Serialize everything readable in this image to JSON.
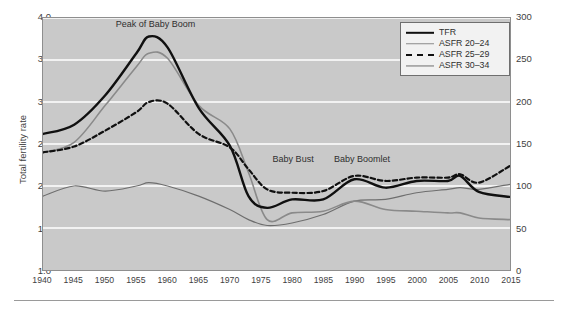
{
  "chart_data": {
    "type": "line",
    "title": "",
    "xlabel": "",
    "ylabel": "Total fertility rate",
    "ylabel_right": "ASFR (births per 1,000 women)",
    "xlim": [
      1940,
      2015
    ],
    "ylim": [
      1.0,
      4.0
    ],
    "ylim_right": [
      0,
      300
    ],
    "grid": true,
    "legend_position": "top-right",
    "xticks": [
      1940,
      1945,
      1950,
      1955,
      1960,
      1965,
      1970,
      1975,
      1980,
      1985,
      1990,
      1995,
      2000,
      2005,
      2010,
      2015
    ],
    "yticks": [
      "1.0",
      "1.5",
      "2.0",
      "2.5",
      "3.0",
      "3.5",
      "4.0"
    ],
    "yticks_right": [
      "0",
      "50",
      "100",
      "150",
      "200",
      "250",
      "300"
    ],
    "x": [
      1940,
      1945,
      1950,
      1955,
      1957,
      1960,
      1965,
      1970,
      1973,
      1976,
      1980,
      1985,
      1990,
      1995,
      2000,
      2005,
      2007,
      2010,
      2015
    ],
    "series": [
      {
        "name": "TFR",
        "color": "#101010",
        "style": "solid",
        "width": 2.4,
        "axis": "left",
        "values": [
          2.62,
          2.73,
          3.08,
          3.58,
          3.78,
          3.65,
          2.93,
          2.48,
          1.88,
          1.74,
          1.84,
          1.84,
          2.08,
          1.98,
          2.06,
          2.06,
          2.12,
          1.93,
          1.87
        ]
      },
      {
        "name": "ASFR 20-24",
        "color": "#8a8a8a",
        "style": "solid",
        "width": 1.6,
        "axis": "right",
        "values": [
          140,
          152,
          196,
          242,
          258,
          252,
          196,
          168,
          116,
          60,
          68,
          70,
          82,
          72,
          70,
          68,
          68,
          62,
          60
        ]
      },
      {
        "name": "ASFR 25-29",
        "color": "#101010",
        "style": "dashed",
        "width": 2.2,
        "axis": "right",
        "values": [
          140,
          147,
          166,
          188,
          200,
          198,
          162,
          146,
          120,
          96,
          92,
          94,
          112,
          106,
          110,
          110,
          114,
          104,
          124
        ]
      },
      {
        "name": "ASFR 30-34",
        "color": "#6e6e6e",
        "style": "solid",
        "width": 1.2,
        "axis": "right",
        "values": [
          88,
          100,
          94,
          100,
          104,
          100,
          88,
          72,
          60,
          53,
          56,
          66,
          82,
          84,
          92,
          96,
          98,
          96,
          102
        ]
      }
    ],
    "annotations": [
      {
        "text": "Peak of Baby Boom",
        "x": 1958,
        "y": 3.92
      },
      {
        "text": "Baby Bust",
        "x": 1980,
        "y": 2.32
      },
      {
        "text": "Baby Boomlet",
        "x": 1991,
        "y": 2.32
      }
    ]
  },
  "legend": {
    "items": [
      {
        "label": "TFR"
      },
      {
        "label": "ASFR 20–24"
      },
      {
        "label": "ASFR 25–29"
      },
      {
        "label": "ASFR 30–34"
      }
    ]
  },
  "colors": {
    "plot_background": "#c9c9c9",
    "gridline": "#ffffff",
    "frame": "#8e8e8e",
    "text": "#3a3a3a"
  }
}
